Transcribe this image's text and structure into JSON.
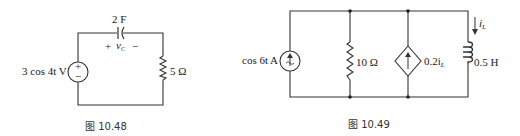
{
  "figures": [
    {
      "caption": "图 10.48",
      "source": {
        "type": "independent-voltage",
        "label": "3 cos 4t V",
        "plus": "+",
        "minus": "−"
      },
      "capacitor": {
        "label": "2 F",
        "voltage_label": "v",
        "voltage_sub": "C",
        "plus": "+",
        "minus": "−"
      },
      "resistor": {
        "label": "5 Ω"
      }
    },
    {
      "caption": "图 10.49",
      "source": {
        "type": "independent-current",
        "label": "cos 6t A"
      },
      "resistor": {
        "label": "10 Ω"
      },
      "dependent_source": {
        "type": "dependent-current",
        "label": "0.2i",
        "label_sub": "L"
      },
      "inductor": {
        "label": "0.5 H",
        "current_label": "i",
        "current_sub": "L"
      }
    }
  ]
}
